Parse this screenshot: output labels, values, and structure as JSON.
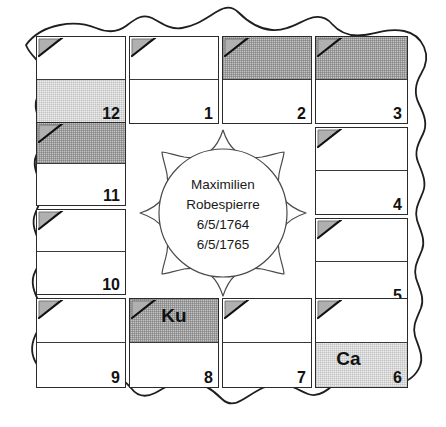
{
  "chart": {
    "center": {
      "name_line_1": "Maximilien",
      "name_line_2": "Robespierre",
      "date_line_1": "6/5/1764",
      "date_line_2": "6/5/1765"
    },
    "colors": {
      "ink": "#2b2b2b",
      "shade_light": "#ededed",
      "shade_dark": "#c3c3c3",
      "paper": "#ffffff"
    },
    "houses": [
      {
        "number": "12",
        "top_shade": "white",
        "bottom_shade": "light",
        "top_glyph": "",
        "bottom_glyph": ""
      },
      {
        "number": "1",
        "top_shade": "white",
        "bottom_shade": "white",
        "top_glyph": "",
        "bottom_glyph": ""
      },
      {
        "number": "2",
        "top_shade": "dark",
        "bottom_shade": "white",
        "top_glyph": "",
        "bottom_glyph": ""
      },
      {
        "number": "3",
        "top_shade": "dark",
        "bottom_shade": "white",
        "top_glyph": "",
        "bottom_glyph": ""
      },
      {
        "number": "4",
        "top_shade": "white",
        "bottom_shade": "white",
        "top_glyph": "",
        "bottom_glyph": ""
      },
      {
        "number": "5",
        "top_shade": "white",
        "bottom_shade": "white",
        "top_glyph": "",
        "bottom_glyph": ""
      },
      {
        "number": "6",
        "top_shade": "white",
        "bottom_shade": "light",
        "top_glyph": "",
        "bottom_glyph": "Ca"
      },
      {
        "number": "7",
        "top_shade": "white",
        "bottom_shade": "white",
        "top_glyph": "",
        "bottom_glyph": ""
      },
      {
        "number": "8",
        "top_shade": "dark",
        "bottom_shade": "white",
        "top_glyph": "Ku",
        "bottom_glyph": ""
      },
      {
        "number": "9",
        "top_shade": "white",
        "bottom_shade": "white",
        "top_glyph": "",
        "bottom_glyph": ""
      },
      {
        "number": "10",
        "top_shade": "white",
        "bottom_shade": "white",
        "top_glyph": "",
        "bottom_glyph": ""
      },
      {
        "number": "11",
        "top_shade": "dark",
        "bottom_shade": "white",
        "top_glyph": "",
        "bottom_glyph": ""
      }
    ]
  }
}
